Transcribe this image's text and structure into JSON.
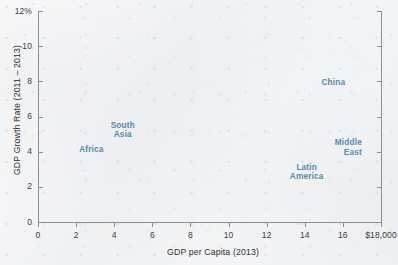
{
  "chart_data": {
    "type": "scatter",
    "title": "",
    "xlabel": "GDP per Capita (2013)",
    "ylabel": "GDP Growth Rate (2011 – 2013)",
    "xlim": [
      0,
      18
    ],
    "ylim": [
      0,
      12
    ],
    "grid": false,
    "legend": "none",
    "xticks": [
      {
        "value": 0,
        "label": "0"
      },
      {
        "value": 2,
        "label": "2"
      },
      {
        "value": 4,
        "label": "4"
      },
      {
        "value": 6,
        "label": "6"
      },
      {
        "value": 8,
        "label": "8"
      },
      {
        "value": 10,
        "label": "10"
      },
      {
        "value": 12,
        "label": "12"
      },
      {
        "value": 14,
        "label": "14"
      },
      {
        "value": 16,
        "label": "16"
      },
      {
        "value": 18,
        "label": "$18,000"
      }
    ],
    "yticks": [
      {
        "value": 0,
        "label": "0"
      },
      {
        "value": 2,
        "label": "2"
      },
      {
        "value": 4,
        "label": "4"
      },
      {
        "value": 6,
        "label": "6"
      },
      {
        "value": 8,
        "label": "8"
      },
      {
        "value": 10,
        "label": "10"
      },
      {
        "value": 12,
        "label": "12%"
      }
    ],
    "point_color": "#5b8ba6",
    "axis_color": "#8c8f93",
    "background_color": "#f6f7f8",
    "points": [
      {
        "name": "Africa",
        "label": "Africa",
        "x": 2.8,
        "y": 4.1,
        "align": "center"
      },
      {
        "name": "South Asia",
        "label": "South\nAsia",
        "x": 4.45,
        "y": 5.2,
        "align": "center"
      },
      {
        "name": "Latin America",
        "label": "Latin\nAmerica",
        "x": 14.1,
        "y": 2.8,
        "align": "center"
      },
      {
        "name": "China",
        "label": "China",
        "x": 15.5,
        "y": 7.9,
        "align": "center"
      },
      {
        "name": "Middle East",
        "label": "Middle\nEast",
        "x": 17.0,
        "y": 4.2,
        "align": "right"
      }
    ]
  }
}
